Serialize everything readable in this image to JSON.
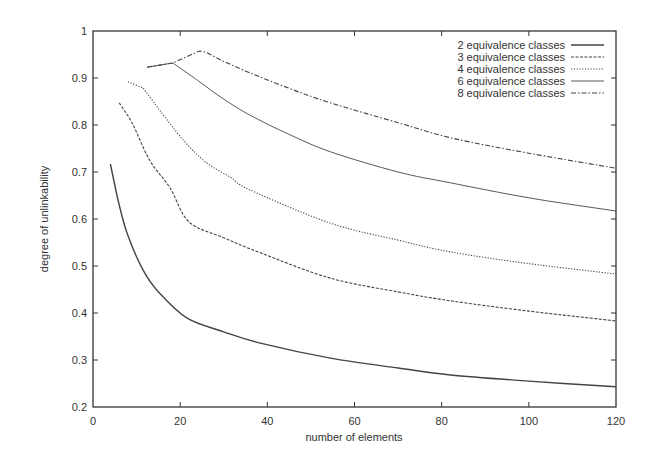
{
  "chart_data": {
    "type": "line",
    "title": "",
    "xlabel": "number of elements",
    "ylabel": "degree of unlinkability",
    "xlim": [
      0,
      120
    ],
    "ylim": [
      0.2,
      1.0
    ],
    "xticks": [
      0,
      20,
      40,
      60,
      80,
      100,
      120
    ],
    "yticks": [
      0.2,
      0.3,
      0.4,
      0.5,
      0.6,
      0.7,
      0.8,
      0.9,
      1
    ],
    "ytick_labels": [
      "0.2",
      "0.3",
      "0.4",
      "0.5",
      "0.6",
      "0.7",
      "0.8",
      "0.9",
      "1"
    ],
    "grid": false,
    "legend_position": "top-right",
    "series": [
      {
        "name": "2 equivalence classes",
        "style": "solid",
        "x": [
          4,
          6,
          8,
          11.5,
          15,
          21.6,
          30,
          38.4,
          54.5,
          70,
          82,
          100,
          120
        ],
        "values": [
          0.717,
          0.63,
          0.565,
          0.491,
          0.445,
          0.389,
          0.36,
          0.336,
          0.304,
          0.283,
          0.268,
          0.255,
          0.243
        ]
      },
      {
        "name": "3 equivalence classes",
        "style": "dashed",
        "x": [
          6,
          9,
          13,
          17.7,
          22,
          30,
          38.4,
          54.5,
          70,
          82,
          100,
          120
        ],
        "values": [
          0.847,
          0.804,
          0.725,
          0.666,
          0.594,
          0.56,
          0.528,
          0.474,
          0.445,
          0.426,
          0.404,
          0.383
        ]
      },
      {
        "name": "4 equivalence classes",
        "style": "dotted",
        "x": [
          8,
          11.5,
          15,
          20.7,
          26,
          31.5,
          36,
          54.5,
          70,
          82,
          100,
          120
        ],
        "values": [
          0.892,
          0.879,
          0.835,
          0.768,
          0.72,
          0.689,
          0.662,
          0.591,
          0.555,
          0.53,
          0.505,
          0.483
        ]
      },
      {
        "name": "6 equivalence classes",
        "style": "thin-solid",
        "x": [
          12.4,
          18.3,
          24,
          30,
          36,
          45,
          54.5,
          70,
          82,
          100,
          120
        ],
        "values": [
          0.923,
          0.932,
          0.895,
          0.855,
          0.821,
          0.78,
          0.743,
          0.7,
          0.677,
          0.645,
          0.617
        ]
      },
      {
        "name": "8 equivalence classes",
        "style": "dash-dot",
        "x": [
          12.4,
          18.3,
          24.3,
          30,
          36,
          45,
          54.5,
          70,
          82,
          100,
          120
        ],
        "values": [
          0.923,
          0.932,
          0.957,
          0.935,
          0.911,
          0.878,
          0.847,
          0.805,
          0.773,
          0.74,
          0.708
        ]
      }
    ]
  },
  "colors": {
    "axis": "#333333",
    "line": "#444444",
    "background": "#ffffff"
  }
}
